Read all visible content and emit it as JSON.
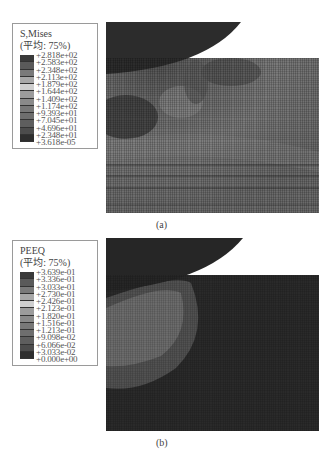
{
  "figure_a": {
    "caption": "(a)",
    "legend": {
      "variable": "S,Mises",
      "averaging": "(平均: 75%)",
      "values": [
        "+2.818e+02",
        "+2.583e+02",
        "+2.348e+02",
        "+2.113e+02",
        "+1.879e+02",
        "+1.644e+02",
        "+1.409e+02",
        "+1.174e+02",
        "+9.393e+01",
        "+7.045e+01",
        "+4.696e+01",
        "+2.348e+01",
        "+3.618e-05"
      ],
      "band_colors": [
        "#3a3a3a",
        "#5a5a5a",
        "#7a7a7a",
        "#a8a8a8",
        "#cfcfcf",
        "#9c9c9c",
        "#8a8a8a",
        "#787878",
        "#6e6e6e",
        "#5e5e5e",
        "#4c4c4c",
        "#2e2e2e"
      ]
    }
  },
  "figure_b": {
    "caption": "(b)",
    "legend": {
      "variable": "PEEQ",
      "averaging": "(平均: 75%)",
      "values": [
        "+3.639e-01",
        "+3.336e-01",
        "+3.033e-01",
        "+2.730e-01",
        "+2.426e-01",
        "+2.123e-01",
        "+1.820e-01",
        "+1.516e-01",
        "+1.213e-01",
        "+9.098e-02",
        "+6.066e-02",
        "+3.033e-02",
        "+0.000e+00"
      ],
      "band_colors": [
        "#3a3a3a",
        "#5a5a5a",
        "#7a7a7a",
        "#a8a8a8",
        "#cfcfcf",
        "#9c9c9c",
        "#8a8a8a",
        "#787878",
        "#6e6e6e",
        "#5e5e5e",
        "#4c4c4c",
        "#2e2e2e"
      ]
    }
  }
}
